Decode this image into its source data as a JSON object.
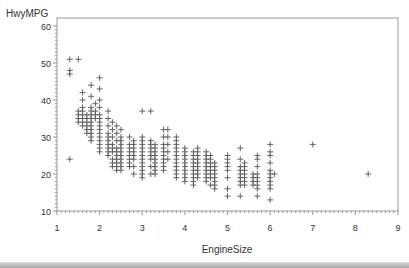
{
  "chart_data": {
    "type": "scatter",
    "title": "",
    "xlabel": "EngineSize",
    "ylabel": "HwyMPG",
    "xlim": [
      1,
      9
    ],
    "ylim": [
      10,
      60
    ],
    "xticks": [
      1,
      2,
      3,
      4,
      5,
      6,
      7,
      8,
      9
    ],
    "yticks": [
      10,
      20,
      30,
      40,
      50,
      60
    ],
    "grid": false,
    "legend": null,
    "marker": "plus",
    "marker_color": "#555555",
    "points": [
      [
        1.3,
        51
      ],
      [
        1.5,
        51
      ],
      [
        1.3,
        48
      ],
      [
        1.3,
        47
      ],
      [
        1.3,
        24
      ],
      [
        1.6,
        42
      ],
      [
        1.6,
        40
      ],
      [
        1.6,
        38
      ],
      [
        1.6,
        37
      ],
      [
        1.6,
        36
      ],
      [
        1.6,
        35
      ],
      [
        1.6,
        34
      ],
      [
        1.6,
        33
      ],
      [
        1.5,
        37
      ],
      [
        1.5,
        36
      ],
      [
        1.5,
        35
      ],
      [
        1.5,
        34
      ],
      [
        1.7,
        36
      ],
      [
        1.7,
        35
      ],
      [
        1.7,
        34
      ],
      [
        1.7,
        33
      ],
      [
        1.7,
        32
      ],
      [
        1.7,
        31
      ],
      [
        1.8,
        44
      ],
      [
        1.8,
        41
      ],
      [
        1.8,
        38
      ],
      [
        1.8,
        37
      ],
      [
        1.8,
        36
      ],
      [
        1.8,
        35
      ],
      [
        1.8,
        34
      ],
      [
        1.8,
        33
      ],
      [
        1.8,
        32
      ],
      [
        1.8,
        31
      ],
      [
        1.8,
        30
      ],
      [
        1.8,
        29
      ],
      [
        1.9,
        39
      ],
      [
        1.9,
        37
      ],
      [
        1.9,
        36
      ],
      [
        1.9,
        35
      ],
      [
        2.0,
        46
      ],
      [
        2.0,
        43
      ],
      [
        2.0,
        40
      ],
      [
        2.0,
        38
      ],
      [
        2.0,
        36
      ],
      [
        2.0,
        35
      ],
      [
        2.0,
        34
      ],
      [
        2.0,
        33
      ],
      [
        2.0,
        32
      ],
      [
        2.0,
        31
      ],
      [
        2.0,
        30
      ],
      [
        2.0,
        29
      ],
      [
        2.0,
        28
      ],
      [
        2.0,
        27
      ],
      [
        2.0,
        26
      ],
      [
        2.2,
        37
      ],
      [
        2.2,
        35
      ],
      [
        2.2,
        33
      ],
      [
        2.2,
        31
      ],
      [
        2.2,
        30
      ],
      [
        2.2,
        29
      ],
      [
        2.2,
        28
      ],
      [
        2.2,
        27
      ],
      [
        2.2,
        26
      ],
      [
        2.2,
        25
      ],
      [
        2.3,
        34
      ],
      [
        2.3,
        32
      ],
      [
        2.3,
        30
      ],
      [
        2.3,
        28
      ],
      [
        2.3,
        27
      ],
      [
        2.3,
        26
      ],
      [
        2.3,
        24
      ],
      [
        2.3,
        23
      ],
      [
        2.3,
        22
      ],
      [
        2.4,
        33
      ],
      [
        2.4,
        31
      ],
      [
        2.4,
        29
      ],
      [
        2.4,
        27
      ],
      [
        2.4,
        26
      ],
      [
        2.4,
        25
      ],
      [
        2.4,
        24
      ],
      [
        2.4,
        23
      ],
      [
        2.4,
        22
      ],
      [
        2.4,
        21
      ],
      [
        2.5,
        32
      ],
      [
        2.5,
        30
      ],
      [
        2.5,
        29
      ],
      [
        2.5,
        28
      ],
      [
        2.5,
        27
      ],
      [
        2.5,
        26
      ],
      [
        2.5,
        25
      ],
      [
        2.5,
        24
      ],
      [
        2.5,
        23
      ],
      [
        2.5,
        22
      ],
      [
        2.5,
        21
      ],
      [
        2.7,
        30
      ],
      [
        2.7,
        28
      ],
      [
        2.7,
        27
      ],
      [
        2.7,
        26
      ],
      [
        2.7,
        25
      ],
      [
        2.7,
        24
      ],
      [
        2.7,
        23
      ],
      [
        2.7,
        22
      ],
      [
        2.8,
        29
      ],
      [
        2.8,
        28
      ],
      [
        2.8,
        27
      ],
      [
        2.8,
        26
      ],
      [
        2.8,
        25
      ],
      [
        2.8,
        24
      ],
      [
        2.8,
        22
      ],
      [
        2.8,
        20
      ],
      [
        3.0,
        37
      ],
      [
        3.0,
        30
      ],
      [
        3.0,
        29
      ],
      [
        3.0,
        28
      ],
      [
        3.0,
        27
      ],
      [
        3.0,
        26
      ],
      [
        3.0,
        25
      ],
      [
        3.0,
        24
      ],
      [
        3.0,
        23
      ],
      [
        3.0,
        22
      ],
      [
        3.0,
        21
      ],
      [
        3.0,
        20
      ],
      [
        3.0,
        19
      ],
      [
        3.2,
        37
      ],
      [
        3.2,
        29
      ],
      [
        3.2,
        28
      ],
      [
        3.2,
        27
      ],
      [
        3.2,
        26
      ],
      [
        3.2,
        25
      ],
      [
        3.2,
        24
      ],
      [
        3.2,
        22
      ],
      [
        3.2,
        20
      ],
      [
        3.3,
        28
      ],
      [
        3.3,
        27
      ],
      [
        3.3,
        26
      ],
      [
        3.3,
        25
      ],
      [
        3.3,
        24
      ],
      [
        3.3,
        23
      ],
      [
        3.3,
        22
      ],
      [
        3.3,
        21
      ],
      [
        3.3,
        20
      ],
      [
        3.5,
        32
      ],
      [
        3.5,
        30
      ],
      [
        3.5,
        28
      ],
      [
        3.5,
        27
      ],
      [
        3.5,
        26
      ],
      [
        3.5,
        25
      ],
      [
        3.5,
        24
      ],
      [
        3.5,
        23
      ],
      [
        3.5,
        22
      ],
      [
        3.5,
        21
      ],
      [
        3.6,
        32
      ],
      [
        3.6,
        30
      ],
      [
        3.6,
        28
      ],
      [
        3.6,
        26
      ],
      [
        3.6,
        24
      ],
      [
        3.8,
        30
      ],
      [
        3.8,
        29
      ],
      [
        3.8,
        28
      ],
      [
        3.8,
        27
      ],
      [
        3.8,
        26
      ],
      [
        3.8,
        25
      ],
      [
        3.8,
        24
      ],
      [
        3.8,
        23
      ],
      [
        3.8,
        22
      ],
      [
        3.8,
        21
      ],
      [
        3.8,
        20
      ],
      [
        3.8,
        19
      ],
      [
        4.0,
        27
      ],
      [
        4.0,
        26
      ],
      [
        4.0,
        25
      ],
      [
        4.0,
        24
      ],
      [
        4.0,
        23
      ],
      [
        4.0,
        22
      ],
      [
        4.0,
        21
      ],
      [
        4.0,
        20
      ],
      [
        4.0,
        19
      ],
      [
        4.0,
        18
      ],
      [
        4.2,
        26
      ],
      [
        4.2,
        25
      ],
      [
        4.2,
        24
      ],
      [
        4.2,
        23
      ],
      [
        4.2,
        22
      ],
      [
        4.2,
        21
      ],
      [
        4.2,
        20
      ],
      [
        4.2,
        19
      ],
      [
        4.2,
        18
      ],
      [
        4.2,
        17
      ],
      [
        4.3,
        27
      ],
      [
        4.3,
        26
      ],
      [
        4.3,
        25
      ],
      [
        4.3,
        24
      ],
      [
        4.3,
        23
      ],
      [
        4.3,
        22
      ],
      [
        4.3,
        21
      ],
      [
        4.3,
        20
      ],
      [
        4.3,
        19
      ],
      [
        4.5,
        26
      ],
      [
        4.5,
        25
      ],
      [
        4.5,
        24
      ],
      [
        4.5,
        23
      ],
      [
        4.5,
        22
      ],
      [
        4.5,
        21
      ],
      [
        4.5,
        20
      ],
      [
        4.5,
        19
      ],
      [
        4.5,
        18
      ],
      [
        4.6,
        25
      ],
      [
        4.6,
        24
      ],
      [
        4.6,
        23
      ],
      [
        4.6,
        22
      ],
      [
        4.6,
        21
      ],
      [
        4.6,
        20
      ],
      [
        4.6,
        19
      ],
      [
        4.6,
        17
      ],
      [
        4.7,
        23
      ],
      [
        4.7,
        22
      ],
      [
        4.7,
        21
      ],
      [
        4.7,
        20
      ],
      [
        4.7,
        19
      ],
      [
        4.7,
        18
      ],
      [
        4.7,
        17
      ],
      [
        4.7,
        16
      ],
      [
        5.0,
        25
      ],
      [
        5.0,
        24
      ],
      [
        5.0,
        23
      ],
      [
        5.0,
        22
      ],
      [
        5.0,
        21
      ],
      [
        5.0,
        19
      ],
      [
        5.0,
        16
      ],
      [
        5.0,
        14
      ],
      [
        5.3,
        27
      ],
      [
        5.3,
        24
      ],
      [
        5.3,
        22
      ],
      [
        5.3,
        21
      ],
      [
        5.3,
        20
      ],
      [
        5.3,
        19
      ],
      [
        5.3,
        18
      ],
      [
        5.3,
        17
      ],
      [
        5.3,
        14
      ],
      [
        5.4,
        23
      ],
      [
        5.4,
        22
      ],
      [
        5.4,
        21
      ],
      [
        5.4,
        20
      ],
      [
        5.4,
        19
      ],
      [
        5.4,
        18
      ],
      [
        5.4,
        17
      ],
      [
        5.6,
        20
      ],
      [
        5.6,
        19
      ],
      [
        5.6,
        18
      ],
      [
        5.6,
        17
      ],
      [
        5.7,
        25
      ],
      [
        5.7,
        24
      ],
      [
        5.7,
        22
      ],
      [
        5.7,
        20
      ],
      [
        5.7,
        19
      ],
      [
        5.7,
        18
      ],
      [
        5.7,
        17
      ],
      [
        5.7,
        16
      ],
      [
        5.7,
        14
      ],
      [
        6.0,
        28
      ],
      [
        6.0,
        26
      ],
      [
        6.0,
        25
      ],
      [
        6.0,
        23
      ],
      [
        6.0,
        21
      ],
      [
        6.0,
        20
      ],
      [
        6.0,
        19
      ],
      [
        6.0,
        18
      ],
      [
        6.0,
        17
      ],
      [
        6.0,
        16
      ],
      [
        6.0,
        13
      ],
      [
        6.1,
        20
      ],
      [
        7.0,
        28
      ],
      [
        8.3,
        20
      ]
    ]
  }
}
